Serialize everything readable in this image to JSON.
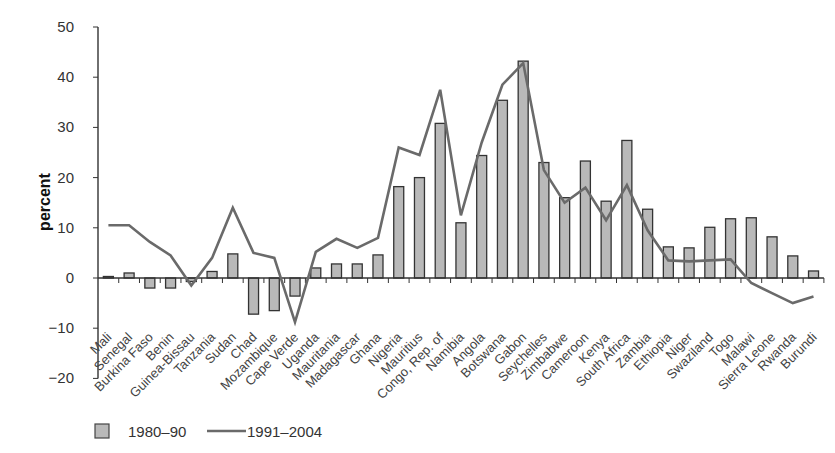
{
  "chart_data": {
    "type": "bar",
    "title": "",
    "xlabel": "",
    "ylabel": "percent",
    "ylim": [
      -20,
      50
    ],
    "yticks": [
      -20,
      -10,
      0,
      10,
      20,
      30,
      40,
      50
    ],
    "ytick_labels": [
      "−20",
      "−10",
      "0",
      "10",
      "20",
      "30",
      "40",
      "50"
    ],
    "grid": false,
    "legend_position": "bottom-left",
    "categories": [
      "Mali",
      "Senegal",
      "Burkina Faso",
      "Benin",
      "Guinea-Bissau",
      "Tanzania",
      "Sudan",
      "Chad",
      "Mozambique",
      "Cape Verde",
      "Uganda",
      "Mauritania",
      "Madagascar",
      "Ghana",
      "Nigeria",
      "Mauritius",
      "Congo, Rep. of",
      "Namibia",
      "Angola",
      "Botswana",
      "Gabon",
      "Seychelles",
      "Zimbabwe",
      "Cameroon",
      "Kenya",
      "South Africa",
      "Zambia",
      "Ethiopia",
      "Niger",
      "Swaziland",
      "Togo",
      "Malawi",
      "Sierra Leone",
      "Rwanda",
      "Burundi"
    ],
    "series": [
      {
        "name": "1980–90",
        "type": "bar",
        "color": "#b9b9b9",
        "values": [
          0.3,
          1.0,
          -2.0,
          -2.0,
          -0.7,
          1.3,
          4.8,
          -7.2,
          -6.5,
          -3.6,
          2.0,
          2.8,
          2.8,
          4.6,
          18.2,
          20.0,
          30.8,
          11.0,
          24.4,
          35.4,
          43.2,
          23.0,
          16.0,
          23.3,
          15.3,
          27.4,
          13.7,
          6.2,
          6.0,
          10.1,
          11.8,
          12.0,
          8.2,
          4.4,
          1.4
        ]
      },
      {
        "name": "1991–2004",
        "type": "line",
        "color": "#6a6a6a",
        "values": [
          10.5,
          10.5,
          7.2,
          4.5,
          -1.5,
          4.0,
          14.0,
          5.0,
          4.0,
          -8.8,
          5.2,
          7.8,
          6.0,
          8.0,
          26.0,
          24.5,
          37.5,
          12.5,
          27.0,
          38.5,
          42.8,
          21.5,
          15.0,
          18.0,
          11.5,
          18.5,
          9.5,
          3.5,
          3.3,
          3.5,
          3.7,
          -1.0,
          -3.0,
          -5.0,
          -3.7
        ]
      }
    ]
  },
  "legend": {
    "items": [
      {
        "label": "1980–90",
        "kind": "bar-swatch"
      },
      {
        "label": "1991–2004",
        "kind": "line-swatch"
      }
    ]
  },
  "colors": {
    "bar_fill": "#b9b9b9",
    "bar_stroke": "#333333",
    "line": "#6a6a6a",
    "axis": "#333333"
  }
}
